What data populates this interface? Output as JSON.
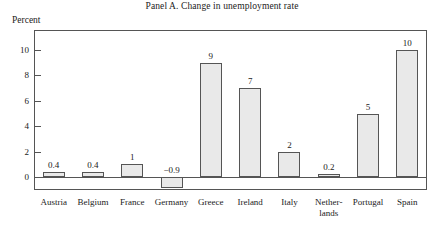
{
  "chart_data": {
    "type": "bar",
    "title": "Panel A. Change in unemployment rate",
    "ylabel": "Percent",
    "xlabel": "",
    "ylim": [
      -2,
      11
    ],
    "yticks": [
      0,
      2,
      4,
      6,
      8,
      10
    ],
    "grid": false,
    "legend": null,
    "categories": [
      "Austria",
      "Belgium",
      "France",
      "Germany",
      "Greece",
      "Ireland",
      "Italy",
      "Nether-\nlands",
      "Portugal",
      "Spain"
    ],
    "values": [
      0.4,
      0.4,
      1,
      -0.9,
      9,
      7,
      2,
      0.2,
      5,
      10
    ],
    "value_labels": [
      "0.4",
      "0.4",
      "1",
      "−0.9",
      "9",
      "7",
      "2",
      "0.2",
      "5",
      "10"
    ],
    "bar_fill_color": "#e9e9e9",
    "bar_edge_color": "#555555",
    "axis_color": "#555555"
  }
}
